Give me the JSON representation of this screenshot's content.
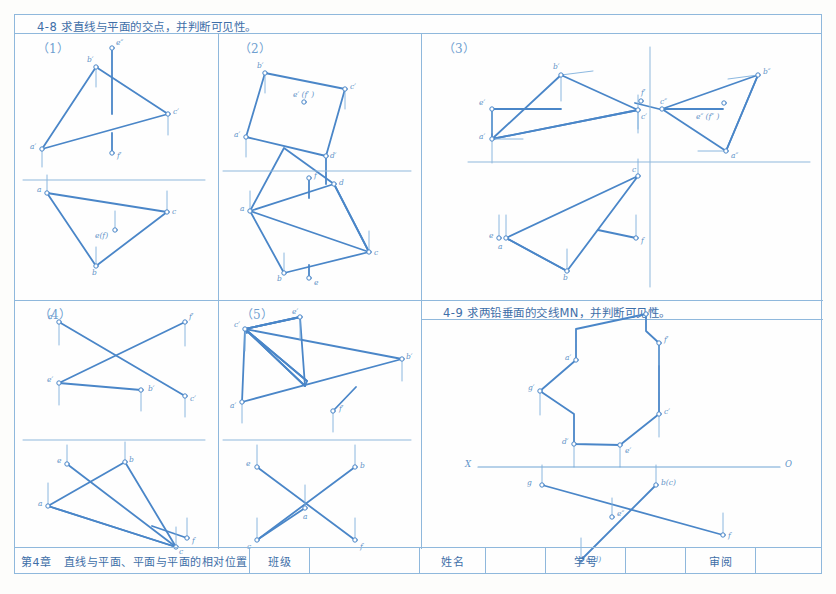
{
  "sheet": {
    "title_49": "4-9  求两铅垂面的交线MN，并判断可见性。",
    "title_48": "4-8  求直线与平面的交点，并判断可见性。",
    "accent": "#4a86c8",
    "rule_color": "#8fb8dc"
  },
  "panels": {
    "p1": {
      "num": "（1）"
    },
    "p2": {
      "num": "（2）"
    },
    "p3": {
      "num": "（3）"
    },
    "p4": {
      "num": "（4）"
    },
    "p5": {
      "num": "（5）"
    }
  },
  "labels": {
    "p1": [
      "b′",
      "e″",
      "c′",
      "a′",
      "f′",
      "a",
      "c",
      "e(f)",
      "b"
    ],
    "p2": [
      "b′",
      "e′ (f′ )",
      "c′",
      "a′",
      "d′",
      "f",
      "d",
      "a",
      "c",
      "b",
      "e"
    ],
    "p3": [
      "b′",
      "f′",
      "c′",
      "e′",
      "a′",
      "c″",
      "b″",
      "e″ (f″ )",
      "a″",
      "e",
      "a",
      "c",
      "f",
      "b"
    ],
    "p4": [
      "a′",
      "f′",
      "b′",
      "e′",
      "c′",
      "e",
      "b",
      "a",
      "c",
      "f"
    ],
    "p5": [
      "e′",
      "c′",
      "b′",
      "a′",
      "f′",
      "e",
      "b",
      "a",
      "c",
      "f"
    ],
    "p49": [
      "b′",
      "f′",
      "a′",
      "g′",
      "c′",
      "d′",
      "e′",
      "X",
      "O",
      "g",
      "b(c)",
      "e″",
      "f",
      "a(d)",
      "F"
    ]
  },
  "footer": {
    "chapter": "第4章",
    "chapter_title": "直线与平面、平面与平面的相对位置",
    "class_label": "班级",
    "class_value": "",
    "name_label": "姓名",
    "name_value": "",
    "id_label": "学号",
    "id_value": "",
    "review_label": "审阅",
    "review_value": ""
  }
}
